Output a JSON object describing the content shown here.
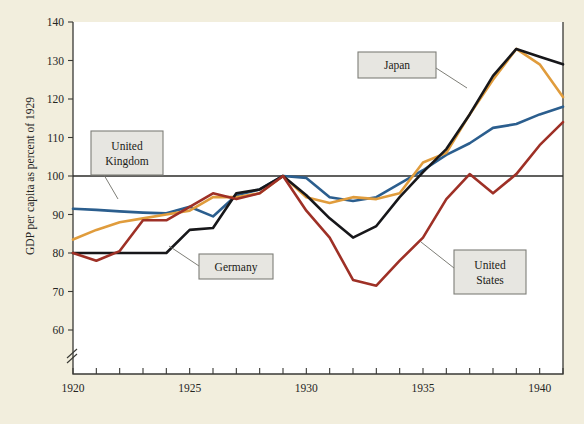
{
  "figure": {
    "background_color": "#f2eedd",
    "plot_background_color": "#ffffff",
    "bleed_text": ""
  },
  "chart_data": {
    "type": "line",
    "title": "",
    "subtitle": "",
    "xlabel": "",
    "ylabel": "GDP per capita as percent of 1929",
    "xlim": [
      1920,
      1941
    ],
    "ylim": [
      60,
      140
    ],
    "y_axis_break_below": 60,
    "y_ticks": [
      60,
      70,
      80,
      90,
      100,
      110,
      120,
      130,
      140
    ],
    "y_tick_labels": [
      "60",
      "70",
      "80",
      "90",
      "100",
      "110",
      "120",
      "130",
      "140"
    ],
    "x_ticks": [
      1920,
      1921,
      1922,
      1923,
      1924,
      1925,
      1926,
      1927,
      1928,
      1929,
      1930,
      1931,
      1932,
      1933,
      1934,
      1935,
      1936,
      1937,
      1938,
      1939,
      1940,
      1941
    ],
    "x_tick_labels": [
      {
        "x": 1920,
        "label": "1920"
      },
      {
        "x": 1925,
        "label": "1925"
      },
      {
        "x": 1930,
        "label": "1930"
      },
      {
        "x": 1935,
        "label": "1935"
      },
      {
        "x": 1940,
        "label": "1940"
      }
    ],
    "grid": false,
    "legend_position": "inline-callouts",
    "reference_lines": [
      {
        "value": 100,
        "orientation": "horizontal",
        "color": "#2b2b28"
      }
    ],
    "x": [
      1920,
      1921,
      1922,
      1923,
      1924,
      1925,
      1926,
      1927,
      1928,
      1929,
      1930,
      1931,
      1932,
      1933,
      1934,
      1935,
      1936,
      1937,
      1938,
      1939,
      1940,
      1941
    ],
    "series": [
      {
        "name": "United Kingdom",
        "color": "#2b5e8e",
        "values": [
          91.5,
          91.2,
          90.8,
          90.5,
          90.3,
          92.0,
          89.5,
          95.0,
          96.5,
          100.0,
          99.5,
          94.5,
          93.5,
          94.5,
          98.0,
          101.5,
          105.5,
          108.5,
          112.5,
          113.5,
          116.0,
          118.0
        ]
      },
      {
        "name": "Japan",
        "color": "#e09c3c",
        "values": [
          83.5,
          86.0,
          88.0,
          89.0,
          90.0,
          91.0,
          94.5,
          94.5,
          95.5,
          100.0,
          94.5,
          93.0,
          94.5,
          94.0,
          95.5,
          103.5,
          106.0,
          116.0,
          125.0,
          133.0,
          129.0,
          120.5
        ]
      },
      {
        "name": "Germany",
        "color": "#17171a",
        "values": [
          80.0,
          80.0,
          80.0,
          80.0,
          80.0,
          86.0,
          86.5,
          95.5,
          96.5,
          100.0,
          95.0,
          89.0,
          84.0,
          87.0,
          94.5,
          101.0,
          107.0,
          116.0,
          126.0,
          133.0,
          131.0,
          129.0
        ]
      },
      {
        "name": "United States",
        "color": "#9e3026",
        "values": [
          80.0,
          78.0,
          80.5,
          88.5,
          88.5,
          92.0,
          95.5,
          94.0,
          95.5,
          100.0,
          91.0,
          84.0,
          73.0,
          71.5,
          78.0,
          84.0,
          94.0,
          100.5,
          95.5,
          100.5,
          108.0,
          114.0
        ]
      }
    ],
    "callouts": [
      {
        "label": "United Kingdom",
        "lines": [
          "United",
          "Kingdom"
        ],
        "box": {
          "x": 91,
          "y": 131,
          "w": 72,
          "h": 44
        },
        "leader": [
          [
            104,
            175
          ],
          [
            118,
            199
          ]
        ]
      },
      {
        "label": "Japan",
        "lines": [
          "Japan"
        ],
        "box": {
          "x": 358,
          "y": 52,
          "w": 78,
          "h": 26
        },
        "leader": [
          [
            436,
            68
          ],
          [
            467,
            88
          ]
        ]
      },
      {
        "label": "Germany",
        "lines": [
          "Germany"
        ],
        "box": {
          "x": 199,
          "y": 254,
          "w": 74,
          "h": 25
        },
        "leader": [
          [
            199,
            266
          ],
          [
            169,
            246
          ]
        ]
      },
      {
        "label": "United States",
        "lines": [
          "United",
          "States"
        ],
        "box": {
          "x": 454,
          "y": 250,
          "w": 72,
          "h": 44
        },
        "leader": [
          [
            454,
            268
          ],
          [
            421,
            242
          ]
        ]
      }
    ]
  }
}
